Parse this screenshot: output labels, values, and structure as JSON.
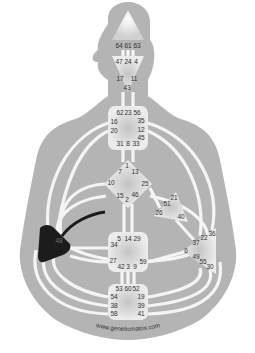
{
  "diagram": {
    "type": "human-design-bodygraph",
    "colors": {
      "background": "#ffffff",
      "silhouette": "#b4b4b4",
      "channel": "#f2f2f2",
      "center_fill": "#e6e6e6",
      "center_glow": "#c4c4c4",
      "defined_center": "#1c1c1c",
      "defined_channel": "#1c1c1c",
      "text": "#333333"
    },
    "watermark": "www.geneticmatrix.com",
    "centers": [
      {
        "name": "head",
        "defined": false,
        "gates": [
          {
            "n": "64",
            "x": 119,
            "y": 46
          },
          {
            "n": "61",
            "x": 128,
            "y": 46
          },
          {
            "n": "63",
            "x": 137,
            "y": 46
          }
        ]
      },
      {
        "name": "ajna",
        "defined": false,
        "gates": [
          {
            "n": "47",
            "x": 119,
            "y": 62
          },
          {
            "n": "24",
            "x": 128,
            "y": 62
          },
          {
            "n": "4",
            "x": 136,
            "y": 62
          },
          {
            "n": "17",
            "x": 120,
            "y": 79
          },
          {
            "n": "11",
            "x": 134,
            "y": 79
          },
          {
            "n": "43",
            "x": 127,
            "y": 88
          }
        ]
      },
      {
        "name": "throat",
        "defined": false,
        "gates": [
          {
            "n": "62",
            "x": 120,
            "y": 113
          },
          {
            "n": "23",
            "x": 128,
            "y": 113
          },
          {
            "n": "56",
            "x": 137,
            "y": 113
          },
          {
            "n": "16",
            "x": 114,
            "y": 122
          },
          {
            "n": "35",
            "x": 141,
            "y": 121
          },
          {
            "n": "20",
            "x": 114,
            "y": 131
          },
          {
            "n": "12",
            "x": 141,
            "y": 130
          },
          {
            "n": "45",
            "x": 141,
            "y": 138
          },
          {
            "n": "31",
            "x": 120,
            "y": 144
          },
          {
            "n": "8",
            "x": 128,
            "y": 144
          },
          {
            "n": "33",
            "x": 136,
            "y": 144
          }
        ]
      },
      {
        "name": "g",
        "defined": false,
        "gates": [
          {
            "n": "1",
            "x": 127,
            "y": 166
          },
          {
            "n": "7",
            "x": 120,
            "y": 172
          },
          {
            "n": "13",
            "x": 135,
            "y": 172
          },
          {
            "n": "10",
            "x": 111,
            "y": 183
          },
          {
            "n": "25",
            "x": 145,
            "y": 184
          },
          {
            "n": "15",
            "x": 120,
            "y": 196
          },
          {
            "n": "46",
            "x": 135,
            "y": 195
          },
          {
            "n": "2",
            "x": 127,
            "y": 200
          }
        ]
      },
      {
        "name": "heart",
        "defined": false,
        "gates": [
          {
            "n": "21",
            "x": 174,
            "y": 198
          },
          {
            "n": "51",
            "x": 167,
            "y": 204
          },
          {
            "n": "26",
            "x": 159,
            "y": 213
          },
          {
            "n": "40",
            "x": 181,
            "y": 217
          }
        ]
      },
      {
        "name": "sacral",
        "defined": false,
        "gates": [
          {
            "n": "5",
            "x": 119,
            "y": 239
          },
          {
            "n": "14",
            "x": 128,
            "y": 239
          },
          {
            "n": "29",
            "x": 137,
            "y": 239
          },
          {
            "n": "34",
            "x": 114,
            "y": 245
          },
          {
            "n": "27",
            "x": 113,
            "y": 261
          },
          {
            "n": "59",
            "x": 143,
            "y": 262
          },
          {
            "n": "42",
            "x": 121,
            "y": 267
          },
          {
            "n": "3",
            "x": 128,
            "y": 267
          },
          {
            "n": "9",
            "x": 135,
            "y": 267
          }
        ]
      },
      {
        "name": "solar-plexus",
        "defined": false,
        "gates": [
          {
            "n": "36",
            "x": 212,
            "y": 234
          },
          {
            "n": "22",
            "x": 204,
            "y": 238
          },
          {
            "n": "37",
            "x": 196,
            "y": 243
          },
          {
            "n": "6",
            "x": 186,
            "y": 251
          },
          {
            "n": "49",
            "x": 196,
            "y": 257
          },
          {
            "n": "55",
            "x": 203,
            "y": 262
          },
          {
            "n": "30",
            "x": 210,
            "y": 267
          }
        ]
      },
      {
        "name": "spleen",
        "defined": true,
        "gates": [
          {
            "n": "48",
            "x": 59,
            "y": 241
          }
        ]
      },
      {
        "name": "root",
        "defined": false,
        "gates": [
          {
            "n": "53",
            "x": 119,
            "y": 289
          },
          {
            "n": "60",
            "x": 128,
            "y": 289
          },
          {
            "n": "52",
            "x": 136,
            "y": 289
          },
          {
            "n": "54",
            "x": 114,
            "y": 297
          },
          {
            "n": "19",
            "x": 141,
            "y": 297
          },
          {
            "n": "38",
            "x": 114,
            "y": 306
          },
          {
            "n": "39",
            "x": 141,
            "y": 306
          },
          {
            "n": "58",
            "x": 114,
            "y": 314
          },
          {
            "n": "41",
            "x": 141,
            "y": 314
          }
        ]
      }
    ],
    "defined_channels": [
      {
        "from": "spleen",
        "to": "g",
        "label": "48-16"
      }
    ]
  }
}
